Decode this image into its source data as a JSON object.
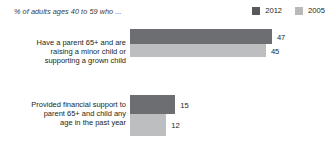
{
  "chart_data": {
    "type": "bar",
    "orientation": "horizontal",
    "title": "",
    "subtitle": "% of adults ages 40 to 59 who ...",
    "xlabel": "",
    "ylabel": "",
    "grid": false,
    "legend_position": "top-right",
    "xlim": [
      0,
      47
    ],
    "categories": [
      "Have a parent 65+ and are raising a minor child or supporting a grown child",
      "Provided financial support to parent 65+ and child any age in the past year"
    ],
    "category_lines": [
      [
        "Have a parent 65+ and are",
        "raising a minor child or",
        "supporting a grown child"
      ],
      [
        "Provided financial support to",
        "parent 65+ and child any",
        "age in the past year"
      ]
    ],
    "series": [
      {
        "name": "2012",
        "color": "#6d6e71",
        "values": [
          47,
          15
        ]
      },
      {
        "name": "2005",
        "color": "#bcbec0",
        "values": [
          45,
          12
        ]
      }
    ]
  },
  "legend": {
    "items": [
      {
        "label": "2012",
        "color": "#6d6e71"
      },
      {
        "label": "2005",
        "color": "#bcbec0"
      }
    ]
  },
  "labels": {
    "g1_2012_value": "47",
    "g1_2005_value": "45",
    "g2_2012_value": "15",
    "g2_2005_value": "12"
  },
  "colors": {
    "series_2012": "#6d6e71",
    "series_2005": "#bcbec0",
    "text": "#231f20",
    "background": "#ffffff"
  }
}
